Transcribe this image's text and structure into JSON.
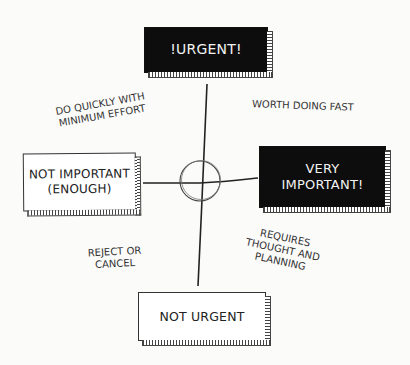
{
  "diagram": {
    "type": "urgency-importance-matrix",
    "axes": {
      "top": {
        "label": "!URGENT!",
        "style": "dark"
      },
      "bottom": {
        "label": "NOT URGENT",
        "style": "light"
      },
      "left": {
        "label_line1": "NOT IMPORTANT",
        "label_line2": "(ENOUGH)",
        "style": "light"
      },
      "right": {
        "label_line1": "VERY",
        "label_line2": "IMPORTANT!",
        "style": "dark"
      }
    },
    "quadrants": {
      "top_left": {
        "line1": "DO QUICKLY WITH",
        "line2": "MINIMUM EFFORT"
      },
      "top_right": {
        "line1": "WORTH DOING FAST"
      },
      "bottom_left": {
        "line1": "REJECT OR",
        "line2": "CANCEL"
      },
      "bottom_right": {
        "line1": "REQUIRES",
        "line2": "THOUGHT AND",
        "line3": "PLANNING"
      }
    },
    "colors": {
      "dark_box": "#0d0d0d",
      "light_box": "#ffffff",
      "line": "#222222",
      "background": "#fbfbfa"
    }
  }
}
